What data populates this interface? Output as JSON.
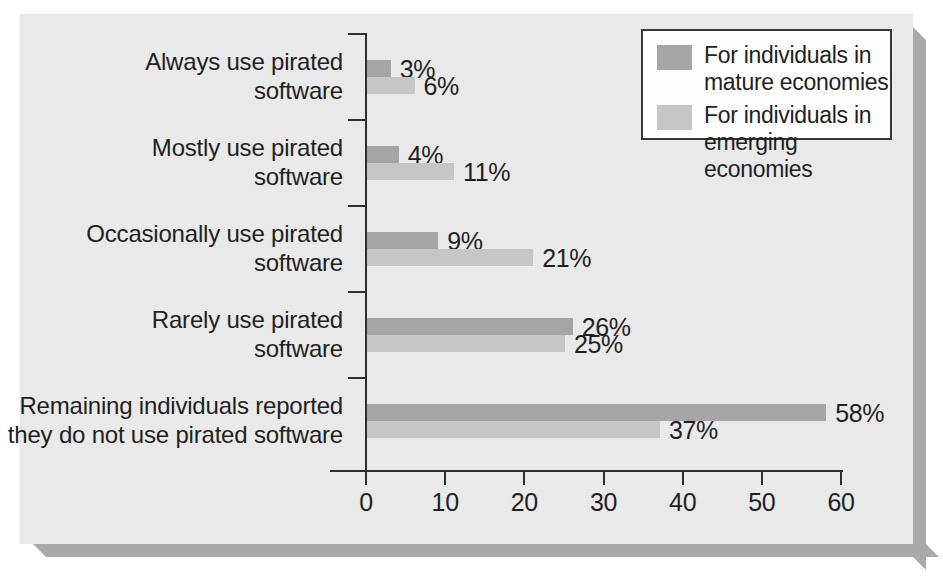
{
  "chart_data": {
    "type": "bar",
    "orientation": "horizontal",
    "title": "",
    "xlabel": "",
    "ylabel": "",
    "xlim": [
      0,
      60
    ],
    "xticks": [
      "0",
      "10",
      "20",
      "30",
      "40",
      "50",
      "60"
    ],
    "grid": false,
    "legend_position": "top-right",
    "categories": [
      "Always use pirated software",
      "Mostly use pirated software",
      "Occasionally use pirated software",
      "Rarely use pirated software",
      "Remaining individuals reported they do not use pirated software"
    ],
    "category_lines": [
      [
        "Always use pirated",
        "software"
      ],
      [
        "Mostly use pirated",
        "software"
      ],
      [
        "Occasionally use pirated",
        "software"
      ],
      [
        "Rarely use pirated",
        "software"
      ],
      [
        "Remaining individuals reported",
        "they do not use pirated software"
      ]
    ],
    "series": [
      {
        "name": "For individuals in mature economies",
        "name_lines": [
          "For individuals in",
          "mature economies"
        ],
        "color": "#a5a5a7",
        "values": [
          3,
          4,
          9,
          26,
          58
        ],
        "labels": [
          "3%",
          "4%",
          "9%",
          "26%",
          "58%"
        ]
      },
      {
        "name": "For individuals in emerging economies",
        "name_lines": [
          "For individuals in",
          "emerging economies"
        ],
        "color": "#c6c6c8",
        "values": [
          6,
          11,
          21,
          25,
          37
        ],
        "labels": [
          "6%",
          "11%",
          "21%",
          "25%",
          "37%"
        ]
      }
    ]
  },
  "colors": {
    "panel_background": "#ececed",
    "mature_bar": "#a5a5a7",
    "emerging_bar": "#c6c6c8",
    "axis": "#2d2d2d",
    "text": "#1f1f1f",
    "legend_background": "#fdfdfd",
    "legend_border": "#383838",
    "panel_shadow": "#a9a9ac"
  }
}
